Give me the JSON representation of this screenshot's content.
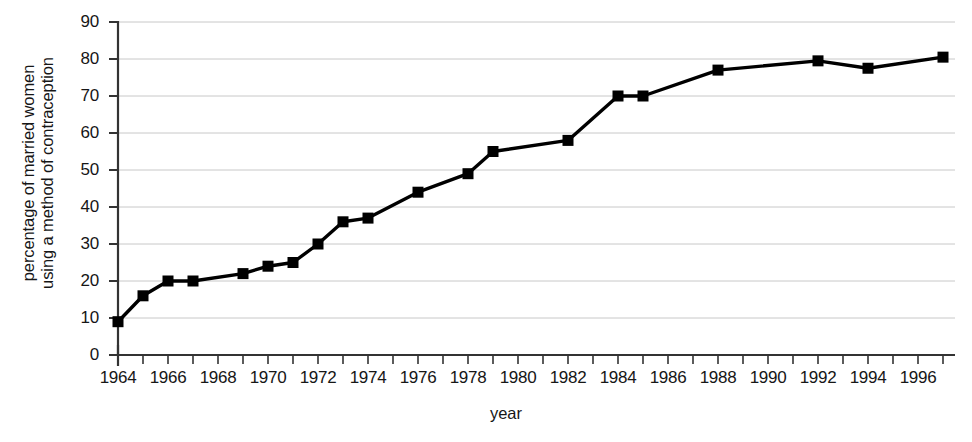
{
  "chart_data": {
    "type": "line",
    "title": "",
    "xlabel": "year",
    "ylabel": "percentage of married women using a method of contraception",
    "ylabel_lines": [
      "percentage of married women",
      "using a method of contraception"
    ],
    "xlim": [
      1964,
      1997
    ],
    "ylim": [
      0,
      90
    ],
    "y_ticks": [
      0,
      10,
      20,
      30,
      40,
      50,
      60,
      70,
      80,
      90
    ],
    "y_tick_labels": [
      "0",
      "10",
      "20",
      "30",
      "40",
      "50",
      "60",
      "70",
      "80",
      "90"
    ],
    "x_ticks": [
      1964,
      1965,
      1966,
      1967,
      1968,
      1969,
      1970,
      1971,
      1972,
      1973,
      1974,
      1975,
      1976,
      1977,
      1978,
      1979,
      1980,
      1981,
      1982,
      1983,
      1984,
      1985,
      1986,
      1987,
      1988,
      1989,
      1990,
      1991,
      1992,
      1993,
      1994,
      1995,
      1996,
      1997
    ],
    "x_tick_labels": [
      "1964",
      "1966",
      "1968",
      "1970",
      "1972",
      "1974",
      "1976",
      "1978",
      "1980",
      "1982",
      "1984",
      "1986",
      "1988",
      "1990",
      "1992",
      "1994",
      "1996"
    ],
    "x_tick_label_years": [
      1964,
      1966,
      1968,
      1970,
      1972,
      1974,
      1976,
      1978,
      1980,
      1982,
      1984,
      1986,
      1988,
      1990,
      1992,
      1994,
      1996
    ],
    "grid": "horizontal",
    "legend": "none",
    "marker": "square",
    "line_color": "#000000",
    "marker_color": "#000000",
    "grid_color": "#c8c8c8",
    "axis_color": "#333333",
    "background": "#ffffff",
    "x": [
      1964,
      1965,
      1966,
      1967,
      1969,
      1970,
      1971,
      1972,
      1973,
      1974,
      1976,
      1978,
      1979,
      1982,
      1984,
      1985,
      1988,
      1992,
      1994,
      1997
    ],
    "values": [
      9,
      16,
      20,
      20,
      22,
      24,
      25,
      30,
      36,
      37,
      44,
      49,
      55,
      58,
      70,
      70,
      77,
      79.5,
      77.5,
      80.5
    ],
    "points": [
      {
        "year": 1964,
        "value": 9
      },
      {
        "year": 1965,
        "value": 16
      },
      {
        "year": 1966,
        "value": 20
      },
      {
        "year": 1967,
        "value": 20
      },
      {
        "year": 1969,
        "value": 22
      },
      {
        "year": 1970,
        "value": 24
      },
      {
        "year": 1971,
        "value": 25
      },
      {
        "year": 1972,
        "value": 30
      },
      {
        "year": 1973,
        "value": 36
      },
      {
        "year": 1974,
        "value": 37
      },
      {
        "year": 1976,
        "value": 44
      },
      {
        "year": 1978,
        "value": 49
      },
      {
        "year": 1979,
        "value": 55
      },
      {
        "year": 1982,
        "value": 58
      },
      {
        "year": 1984,
        "value": 70
      },
      {
        "year": 1985,
        "value": 70
      },
      {
        "year": 1988,
        "value": 77
      },
      {
        "year": 1992,
        "value": 79.5
      },
      {
        "year": 1994,
        "value": 77.5
      },
      {
        "year": 1997,
        "value": 80.5
      }
    ]
  }
}
